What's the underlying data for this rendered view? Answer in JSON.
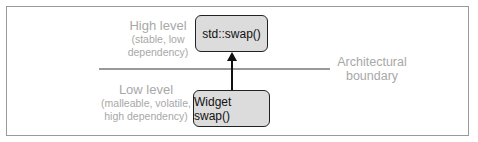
{
  "diagram": {
    "high_level": {
      "title": "High level",
      "subtitle_line1": "(stable, low",
      "subtitle_line2": "dependency)"
    },
    "low_level": {
      "title": "Low level",
      "subtitle_line1": "(malleable, volatile,",
      "subtitle_line2": "high dependency)"
    },
    "boundary": {
      "line1": "Architectural",
      "line2": "boundary"
    },
    "top_box": "std::swap()",
    "bottom_box": "Widget swap()",
    "colors": {
      "box_fill": "#dcdcdc",
      "box_border": "#222222",
      "muted_text": "#a8a8a8",
      "boundary_line": "#999999"
    }
  }
}
